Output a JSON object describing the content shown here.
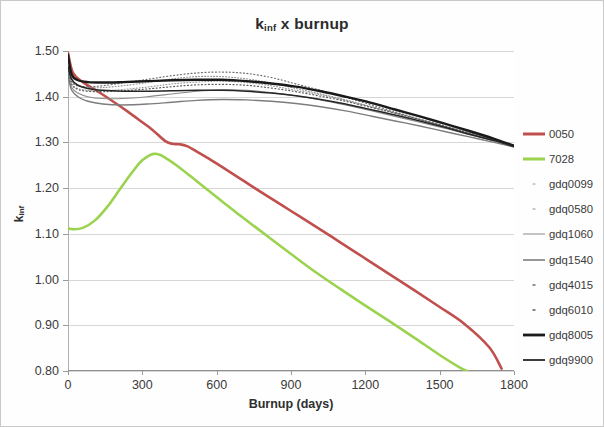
{
  "chart_data": {
    "type": "line",
    "title_main": "k",
    "title_sub": "inf",
    "title_rest": " x burnup",
    "xlabel": "Burnup (days)",
    "ylabel": "k_inf",
    "ylabel_main": "k",
    "ylabel_sub": "inf",
    "grid": true,
    "legend_position": "right",
    "xlim": [
      0,
      1800
    ],
    "ylim": [
      0.8,
      1.5
    ],
    "xticks": [
      0,
      300,
      600,
      900,
      1200,
      1500,
      1800
    ],
    "xtick_labels": [
      "0",
      "300",
      "600",
      "900",
      "1200",
      "1500",
      "1800"
    ],
    "yticks": [
      0.8,
      0.9,
      1.0,
      1.1,
      1.2,
      1.3,
      1.4,
      1.5
    ],
    "ytick_labels": [
      "0.80",
      "0.90",
      "1.00",
      "1.10",
      "1.20",
      "1.30",
      "1.40",
      "1.50"
    ],
    "colors": {
      "0050": "#C0504D",
      "7028": "#9BD34F",
      "gdq0099": "#9a9a9a",
      "gdq0580": "#8f8f8f",
      "gdq1060": "#8a8a8a",
      "gdq1540": "#7d7d7d",
      "gdq4015": "#6e6e6e",
      "gdq6010": "#5c5c5c",
      "gdq8005": "#1a1a1a",
      "gdq9900": "#262626"
    },
    "series": [
      {
        "name": "0050",
        "color": "#C0504D",
        "width": 2.6,
        "dash": "none",
        "x": [
          0,
          20,
          60,
          110,
          170,
          240,
          300,
          340,
          390,
          420,
          450,
          480,
          520,
          570,
          640,
          720,
          800,
          900,
          1000,
          1100,
          1200,
          1300,
          1400,
          1500,
          1600,
          1700,
          1750
        ],
        "y": [
          1.496,
          1.452,
          1.432,
          1.415,
          1.394,
          1.368,
          1.344,
          1.328,
          1.304,
          1.297,
          1.296,
          1.292,
          1.28,
          1.264,
          1.24,
          1.212,
          1.184,
          1.15,
          1.116,
          1.081,
          1.046,
          1.011,
          0.976,
          0.94,
          0.903,
          0.852,
          0.805
        ]
      },
      {
        "name": "7028",
        "color": "#9BD34F",
        "width": 2.6,
        "dash": "none",
        "x": [
          0,
          20,
          60,
          110,
          160,
          210,
          250,
          290,
          320,
          345,
          370,
          400,
          440,
          490,
          550,
          620,
          700,
          800,
          900,
          1000,
          1100,
          1200,
          1300,
          1400,
          1500,
          1580,
          1610
        ],
        "y": [
          1.112,
          1.11,
          1.113,
          1.13,
          1.16,
          1.198,
          1.228,
          1.256,
          1.269,
          1.275,
          1.273,
          1.264,
          1.249,
          1.228,
          1.202,
          1.172,
          1.138,
          1.097,
          1.056,
          1.016,
          0.979,
          0.943,
          0.908,
          0.872,
          0.835,
          0.808,
          0.8
        ]
      },
      {
        "name": "gdq0099",
        "color": "#9a9a9a",
        "width": 1.1,
        "dash": "1,2",
        "x": [
          0,
          15,
          40,
          80,
          140,
          220,
          320,
          420,
          520,
          620,
          720,
          820,
          920,
          1020,
          1120,
          1220,
          1320,
          1420,
          1520,
          1620,
          1720,
          1800
        ],
        "y": [
          1.452,
          1.428,
          1.418,
          1.414,
          1.413,
          1.416,
          1.421,
          1.428,
          1.432,
          1.434,
          1.431,
          1.424,
          1.414,
          1.404,
          1.392,
          1.378,
          1.364,
          1.35,
          1.335,
          1.32,
          1.305,
          1.292
        ]
      },
      {
        "name": "gdq0580",
        "color": "#8f8f8f",
        "width": 1.1,
        "dash": "1,2",
        "x": [
          0,
          15,
          40,
          80,
          140,
          220,
          320,
          420,
          520,
          620,
          720,
          820,
          920,
          1020,
          1120,
          1220,
          1320,
          1420,
          1520,
          1620,
          1720,
          1800
        ],
        "y": [
          1.458,
          1.434,
          1.424,
          1.42,
          1.42,
          1.424,
          1.431,
          1.439,
          1.444,
          1.444,
          1.439,
          1.43,
          1.418,
          1.406,
          1.393,
          1.379,
          1.365,
          1.35,
          1.335,
          1.32,
          1.305,
          1.292
        ]
      },
      {
        "name": "gdq1060",
        "color": "#8a8a8a",
        "width": 1.1,
        "dash": "none",
        "x": [
          0,
          15,
          40,
          80,
          140,
          220,
          320,
          420,
          520,
          620,
          720,
          820,
          920,
          1020,
          1120,
          1220,
          1320,
          1420,
          1520,
          1620,
          1720,
          1800
        ],
        "y": [
          1.448,
          1.42,
          1.408,
          1.4,
          1.396,
          1.396,
          1.4,
          1.406,
          1.412,
          1.415,
          1.414,
          1.409,
          1.402,
          1.393,
          1.382,
          1.37,
          1.357,
          1.344,
          1.331,
          1.317,
          1.303,
          1.291
        ]
      },
      {
        "name": "gdq1540",
        "color": "#7d7d7d",
        "width": 1.4,
        "dash": "none",
        "x": [
          0,
          15,
          40,
          80,
          140,
          220,
          320,
          420,
          520,
          620,
          720,
          820,
          920,
          1020,
          1120,
          1220,
          1320,
          1420,
          1520,
          1620,
          1720,
          1800
        ],
        "y": [
          1.444,
          1.414,
          1.4,
          1.39,
          1.384,
          1.382,
          1.384,
          1.388,
          1.392,
          1.394,
          1.393,
          1.39,
          1.385,
          1.378,
          1.369,
          1.358,
          1.347,
          1.336,
          1.324,
          1.312,
          1.3,
          1.29
        ]
      },
      {
        "name": "gdq4015",
        "color": "#6e6e6e",
        "width": 1.2,
        "dash": "1,2.5",
        "x": [
          0,
          15,
          40,
          80,
          140,
          220,
          320,
          420,
          520,
          620,
          720,
          820,
          920,
          1020,
          1120,
          1220,
          1320,
          1420,
          1520,
          1620,
          1720,
          1800
        ],
        "y": [
          1.456,
          1.432,
          1.424,
          1.422,
          1.424,
          1.43,
          1.438,
          1.446,
          1.452,
          1.454,
          1.451,
          1.442,
          1.428,
          1.414,
          1.399,
          1.383,
          1.367,
          1.351,
          1.335,
          1.319,
          1.304,
          1.292
        ]
      },
      {
        "name": "gdq6010",
        "color": "#5c5c5c",
        "width": 1.2,
        "dash": "1,2.5",
        "x": [
          0,
          15,
          40,
          80,
          140,
          220,
          320,
          420,
          520,
          620,
          720,
          820,
          920,
          1020,
          1120,
          1220,
          1320,
          1420,
          1520,
          1620,
          1720,
          1800
        ],
        "y": [
          1.45,
          1.426,
          1.416,
          1.412,
          1.411,
          1.413,
          1.417,
          1.422,
          1.426,
          1.427,
          1.425,
          1.419,
          1.411,
          1.401,
          1.39,
          1.377,
          1.364,
          1.35,
          1.336,
          1.321,
          1.306,
          1.292
        ]
      },
      {
        "name": "gdq8005",
        "color": "#1a1a1a",
        "width": 2.4,
        "dash": "none",
        "x": [
          0,
          15,
          40,
          80,
          140,
          220,
          320,
          420,
          520,
          620,
          720,
          820,
          920,
          1020,
          1120,
          1220,
          1320,
          1420,
          1520,
          1620,
          1720,
          1800
        ],
        "y": [
          1.492,
          1.448,
          1.436,
          1.432,
          1.431,
          1.432,
          1.434,
          1.436,
          1.437,
          1.437,
          1.434,
          1.429,
          1.422,
          1.412,
          1.4,
          1.387,
          1.372,
          1.357,
          1.341,
          1.325,
          1.308,
          1.293
        ]
      },
      {
        "name": "gdq9900",
        "color": "#262626",
        "width": 1.6,
        "dash": "none",
        "x": [
          0,
          15,
          40,
          80,
          140,
          220,
          320,
          420,
          520,
          620,
          720,
          820,
          920,
          1020,
          1120,
          1220,
          1320,
          1420,
          1520,
          1620,
          1720,
          1800
        ],
        "y": [
          1.466,
          1.438,
          1.425,
          1.418,
          1.414,
          1.412,
          1.412,
          1.413,
          1.414,
          1.414,
          1.412,
          1.408,
          1.402,
          1.394,
          1.384,
          1.372,
          1.36,
          1.347,
          1.333,
          1.318,
          1.304,
          1.291
        ]
      }
    ]
  },
  "legend": {
    "items": [
      {
        "label": "0050",
        "color": "#C0504D",
        "style": "solid",
        "width": 3.0
      },
      {
        "label": "7028",
        "color": "#9BD34F",
        "style": "solid",
        "width": 3.0
      },
      {
        "label": "gdq0099",
        "color": "#9a9a9a",
        "style": "dotted",
        "width": 1.2
      },
      {
        "label": "gdq0580",
        "color": "#8f8f8f",
        "style": "dotted",
        "width": 1.2
      },
      {
        "label": "gdq1060",
        "color": "#8a8a8a",
        "style": "solid",
        "width": 1.0
      },
      {
        "label": "gdq1540",
        "color": "#7d7d7d",
        "style": "solid",
        "width": 1.6
      },
      {
        "label": "gdq4015",
        "color": "#6e6e6e",
        "style": "dotted",
        "width": 1.4
      },
      {
        "label": "gdq6010",
        "color": "#5c5c5c",
        "style": "dotted",
        "width": 1.4
      },
      {
        "label": "gdq8005",
        "color": "#1a1a1a",
        "style": "solid",
        "width": 2.8
      },
      {
        "label": "gdq9900",
        "color": "#262626",
        "style": "solid",
        "width": 1.8
      }
    ]
  }
}
